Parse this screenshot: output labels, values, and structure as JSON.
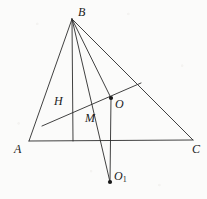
{
  "figure": {
    "width": 207,
    "height": 199,
    "background_color": "#fbfbfa",
    "stroke_color": "#2b2b2b",
    "label_color": "#1a1a1a"
  },
  "points": [
    {
      "id": "A",
      "label": "A",
      "x": 29,
      "y": 141,
      "label_x": 14,
      "label_y": 143,
      "dot": false
    },
    {
      "id": "B",
      "label": "B",
      "x": 72,
      "y": 19,
      "label_x": 78,
      "label_y": 6,
      "dot": false
    },
    {
      "id": "C",
      "label": "C",
      "x": 193,
      "y": 140,
      "label_x": 192,
      "label_y": 143,
      "dot": false
    },
    {
      "id": "H",
      "label": "H",
      "x": 73,
      "y": 104,
      "label_x": 54,
      "label_y": 95,
      "dot": false
    },
    {
      "id": "M",
      "label": "M",
      "x": 80,
      "y": 113,
      "label_x": 85,
      "label_y": 112,
      "dot": false
    },
    {
      "id": "O",
      "label": "O",
      "x": 111,
      "y": 98,
      "label_x": 115,
      "label_y": 98,
      "dot": true
    },
    {
      "id": "O1",
      "label": "O",
      "sub": "1",
      "x": 110,
      "y": 182,
      "label_x": 114,
      "label_y": 170,
      "dot": true
    }
  ],
  "segments": [
    {
      "name": "side-AB",
      "from": [
        72,
        19
      ],
      "to": [
        29,
        141
      ]
    },
    {
      "name": "side-BC",
      "from": [
        72,
        19
      ],
      "to": [
        193,
        140
      ]
    },
    {
      "name": "side-AC",
      "from": [
        29,
        141
      ],
      "to": [
        193,
        140
      ]
    },
    {
      "name": "altitude-B-to-AC",
      "from": [
        72,
        19
      ],
      "to": [
        73,
        141
      ]
    },
    {
      "name": "cevian-B-to-O1",
      "from": [
        72,
        19
      ],
      "to": [
        110,
        182
      ]
    },
    {
      "name": "segment-B-to-O",
      "from": [
        72,
        19
      ],
      "to": [
        111,
        98
      ]
    },
    {
      "name": "euler-line",
      "from": [
        42,
        126
      ],
      "to": [
        141,
        83
      ]
    },
    {
      "name": "segment-O-to-O1",
      "from": [
        111,
        98
      ],
      "to": [
        110,
        182
      ]
    }
  ]
}
